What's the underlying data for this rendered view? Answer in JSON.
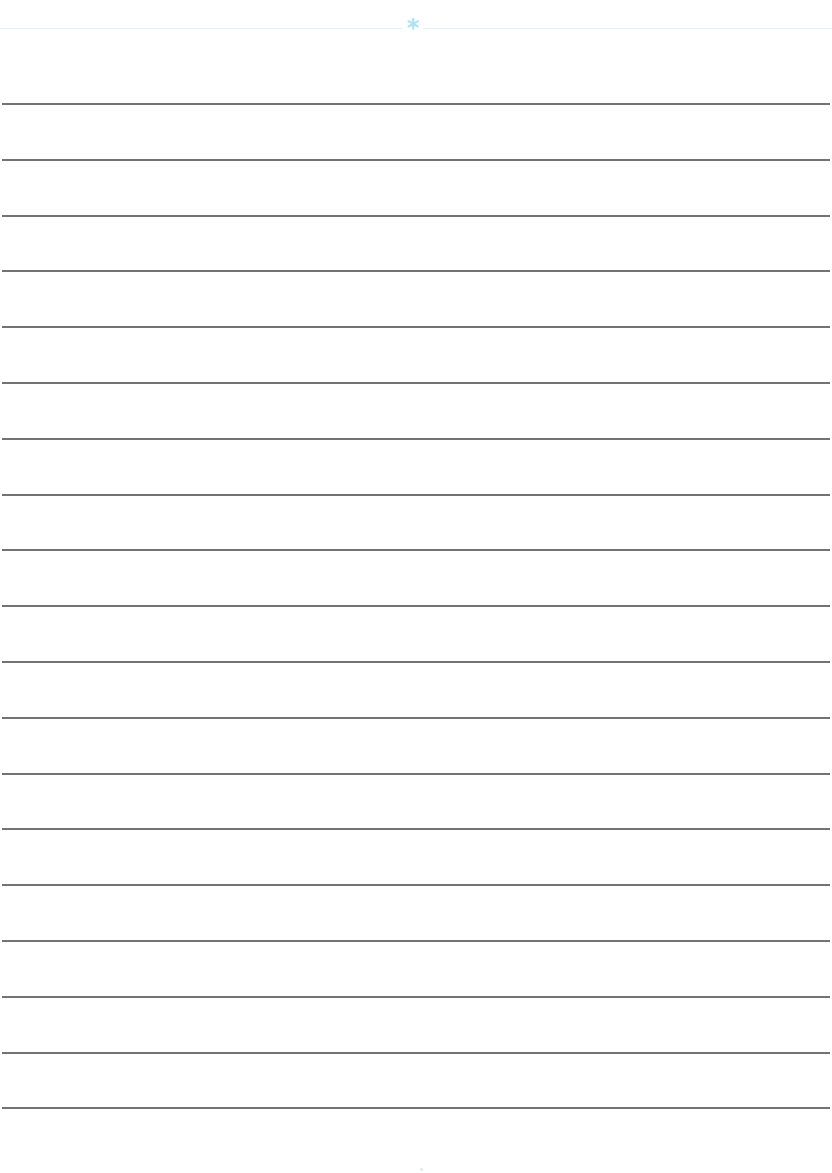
{
  "page": {
    "type": "lined-paper",
    "background_color": "#ffffff",
    "header": {
      "rule_color": "#dff3fa",
      "ornament_glyph": "*",
      "ornament_color": "#a9e3f4"
    },
    "rules": {
      "count": 19,
      "first_y": 103,
      "spacing": 55.8,
      "color": "#5a5a5e"
    },
    "footer": {
      "mark_color": "#cfeff2"
    }
  }
}
